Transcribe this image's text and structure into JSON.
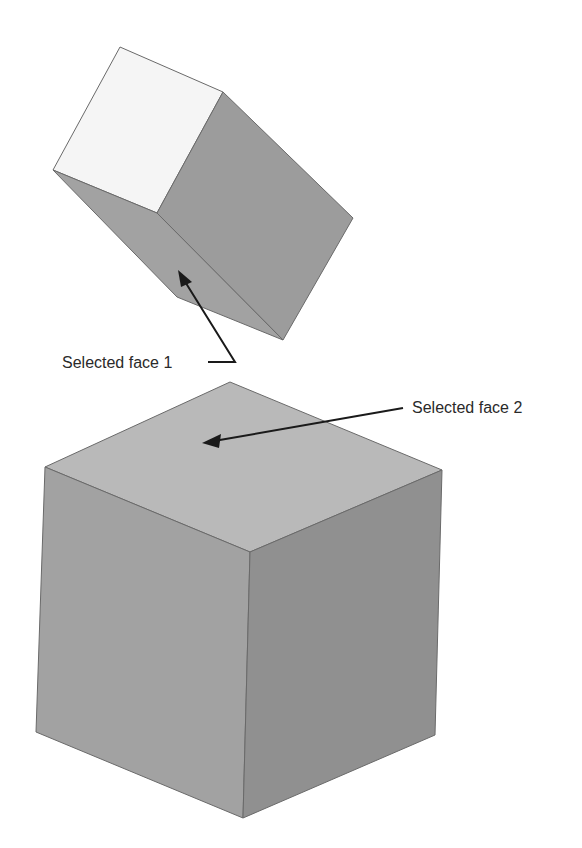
{
  "figure": {
    "labels": {
      "face1": "Selected face 1",
      "face2": "Selected face 2"
    },
    "colors": {
      "background": "#ffffff",
      "edge": "#6a6a6a",
      "small_cube_top": "#f5f5f5",
      "small_cube_right": "#9c9c9c",
      "small_cube_bottom": "#a2a2a2",
      "large_cube_top": "#b9b9b9",
      "large_cube_left": "#a2a2a2",
      "large_cube_right": "#909090",
      "arrow": "#1a1a1a"
    }
  }
}
